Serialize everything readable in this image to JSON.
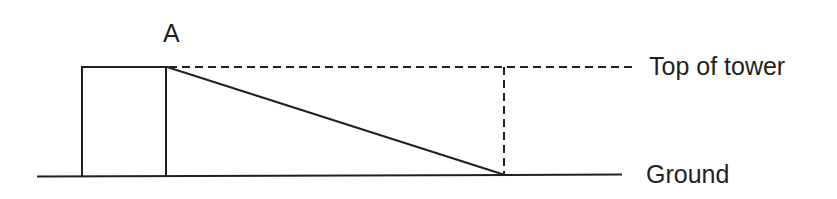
{
  "diagram": {
    "type": "geometry-elevation-diagram",
    "colors": {
      "stroke": "#231f20",
      "text": "#231f20",
      "background": "#ffffff"
    },
    "labels": {
      "vertex_a": "A",
      "top_of_tower": "Top of tower",
      "ground": "Ground"
    },
    "geometry": {
      "ground_line": {
        "x1": 37,
        "y1": 176,
        "x2": 622,
        "y2": 174
      },
      "tower_rect": {
        "x": 81,
        "y": 66,
        "width": 86,
        "height": 110
      },
      "sight_line": {
        "x1": 167,
        "y1": 67,
        "x2": 504,
        "y2": 175
      },
      "horizontal_dashed": {
        "x1": 168,
        "y1": 67,
        "x2": 636,
        "y2": 67
      },
      "vertical_dashed": {
        "x1": 504,
        "y1": 67,
        "x2": 504,
        "y2": 175
      },
      "stroke_width": 2,
      "dash_pattern": "8 5"
    }
  }
}
